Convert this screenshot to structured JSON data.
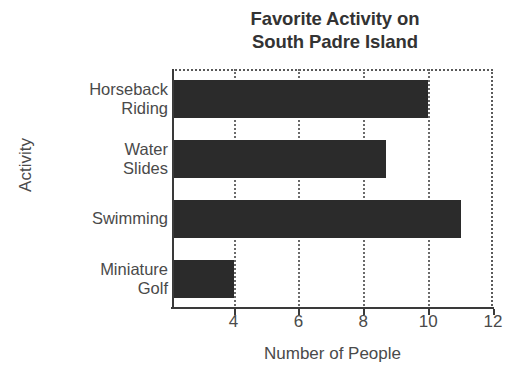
{
  "chart_data": {
    "type": "bar",
    "orientation": "horizontal",
    "title": "Favorite Activity on\nSouth Padre Island",
    "title_line1": "Favorite Activity on",
    "title_line2": "South Padre Island",
    "xlabel": "Number of People",
    "ylabel": "Activity",
    "categories": [
      "Horseback\nRiding",
      "Water\nSlides",
      "Swimming",
      "Miniature\nGolf"
    ],
    "values": [
      10,
      8.7,
      11,
      4
    ],
    "xlim": [
      2.1,
      12
    ],
    "xticks": [
      4,
      6,
      8,
      10,
      12
    ],
    "xtick_labels": [
      "4",
      "6",
      "8",
      "10",
      "12"
    ],
    "grid": "vertical-dotted",
    "legend": "none",
    "bar_color": "#2b2b2b",
    "axis_color": "#3a3a3a",
    "grid_color": "#6a6a6a",
    "background": "#ffffff"
  }
}
